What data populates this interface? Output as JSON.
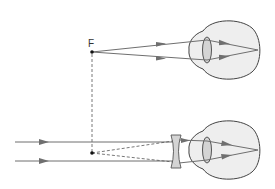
{
  "diagram": {
    "labels": {
      "focal_point": "F"
    },
    "colors": {
      "ray": "#6f6f6f",
      "eye_fill": "#eeeeee",
      "eye_stroke": "#444444",
      "lens_fill": "#d4d4d4",
      "dash": "#555555",
      "point": "#111111"
    },
    "top_panel": {
      "description": "Rays diverging from far point F enter the myopic eye and focus on the retina",
      "far_point": [
        92,
        52
      ],
      "eye_center": [
        228,
        50
      ]
    },
    "bottom_panel": {
      "description": "Parallel rays pass through a concave (diverging) lens and appear to come from F, focusing on the retina",
      "virtual_point": [
        92,
        153
      ],
      "concave_lens_x": 176,
      "eye_center": [
        228,
        150
      ]
    }
  }
}
